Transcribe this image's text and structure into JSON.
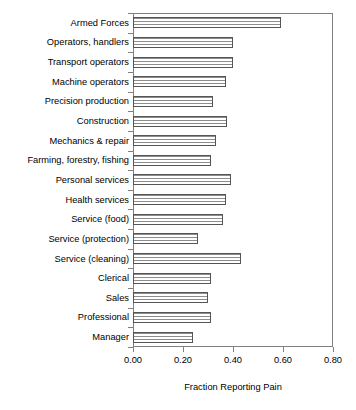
{
  "chart_data": {
    "type": "bar",
    "orientation": "horizontal",
    "title": "",
    "xlabel": "Fraction Reporting Pain",
    "ylabel": "",
    "xlim": [
      0.0,
      0.8
    ],
    "ylim": null,
    "grid": false,
    "legend": null,
    "xticks": [
      "0.00",
      "0.20",
      "0.40",
      "0.60",
      "0.80"
    ],
    "xtick_values": [
      0.0,
      0.2,
      0.4,
      0.6,
      0.8
    ],
    "categories": [
      "Armed Forces",
      "Operators, handlers",
      "Transport operators",
      "Machine operators",
      "Precision production",
      "Construction",
      "Mechanics & repair",
      "Farming, forestry, fishing",
      "Personal services",
      "Health services",
      "Service (food)",
      "Service (protection)",
      "Service (cleaning)",
      "Clerical",
      "Sales",
      "Professional",
      "Manager"
    ],
    "values": [
      0.59,
      0.4,
      0.4,
      0.37,
      0.32,
      0.375,
      0.33,
      0.31,
      0.39,
      0.37,
      0.36,
      0.26,
      0.43,
      0.31,
      0.3,
      0.31,
      0.24
    ],
    "bar_fill": "horizontal-stripe-hatch",
    "bar_edge_color": "#555555",
    "frame_color": "#808080"
  }
}
